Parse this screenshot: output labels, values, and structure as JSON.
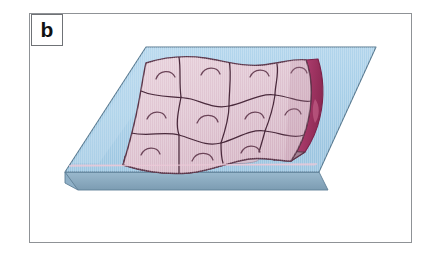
{
  "figure": {
    "panel_label": "b",
    "caption_text": "",
    "background_color": "#ffffff",
    "frame_color": "#8f9296"
  },
  "illustration": {
    "title": "Epithelial cell sheet on a substrate",
    "description": "Three-dimensional isometric drawing of a polygonal epithelial cell monolayer resting on a flat blue substrate slab.",
    "colors": {
      "substrate_top": "#a8cfe8",
      "substrate_top_light": "#c2ddf0",
      "substrate_edge_front": "#7f9fb4",
      "substrate_edge_left": "#93b4cb",
      "substrate_outline": "#5f7f96",
      "sheet_top": "#e0c6d2",
      "sheet_top_light": "#ecd8e0",
      "sheet_outline": "#5a3448",
      "cell_border": "#4a2a3c",
      "nucleus_arc": "#6b4458",
      "sheet_side_right": "#a83a6a",
      "sheet_side_right_dark": "#8e2a56",
      "sheet_front_face": "#9c7a8c",
      "sheet_front_highlight": "#d8bccb",
      "sheet_front_shadow": "#7d5f70"
    },
    "substrate": {
      "name": "blue-substrate-slab",
      "top_face_points": "146,34 371,34 312,170 64,170",
      "front_face_points": "64,170 312,170 312,182 64,182",
      "left_face_points": "64,170 64,182 50,174 50,162",
      "thickness_px": 12
    },
    "cell_sheet": {
      "name": "epithelial-cell-sheet",
      "cell_count": 10,
      "nucleus_count": 10,
      "has_wavy_front_edge": true,
      "side_face_visible": "right"
    }
  }
}
